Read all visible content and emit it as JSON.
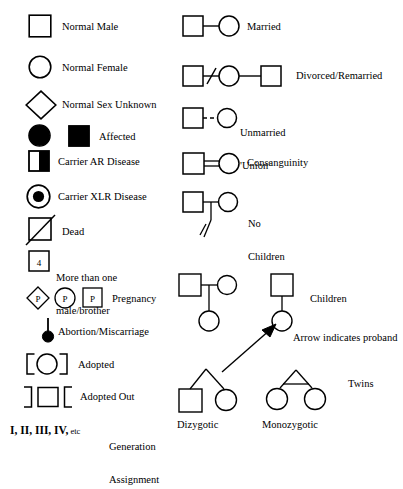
{
  "figure": {
    "stroke_color": "#000000",
    "fill_color": "#000000",
    "background": "#ffffff"
  },
  "left_column": {
    "items": [
      {
        "id": "normal-male",
        "label": "Normal Male",
        "symbol": "square-outline"
      },
      {
        "id": "normal-female",
        "label": "Normal Female",
        "symbol": "circle-outline"
      },
      {
        "id": "normal-sex-unknown",
        "label": "Normal Sex Unknown",
        "symbol": "diamond-outline"
      },
      {
        "id": "affected",
        "label": "Affected",
        "symbol": "filled-circle-and-filled-square"
      },
      {
        "id": "carrier-ar",
        "label": "Carrier AR Disease",
        "symbol": "square-half-filled"
      },
      {
        "id": "carrier-xlr",
        "label": "Carrier XLR Disease",
        "symbol": "circle-with-center-dot"
      },
      {
        "id": "dead",
        "label": "Dead",
        "symbol": "square-with-slash"
      },
      {
        "id": "more-than-one",
        "label": "More than one\nmale/brother",
        "label_line1": "More than one",
        "label_line2": "male/brother",
        "symbol": "square-with-number",
        "number": "4"
      },
      {
        "id": "pregnancy",
        "label": "Pregnancy",
        "symbol": "diamond-p-circle-p-square-p",
        "letter": "P"
      },
      {
        "id": "abortion",
        "label": "Abortion/Miscarriage",
        "symbol": "stem-with-filled-dot"
      },
      {
        "id": "adopted",
        "label": "Adopted",
        "symbol": "circle-in-inward-brackets"
      },
      {
        "id": "adopted-out",
        "label": "Adopted Out",
        "symbol": "square-in-outward-brackets"
      },
      {
        "id": "generation",
        "label": "Generation\nAssignment",
        "label_line1": "Generation",
        "label_line2": "Assignment",
        "roman": "I, II, III, IV,",
        "etc": " etc"
      }
    ]
  },
  "right_column": {
    "items": [
      {
        "id": "married",
        "label": "Married",
        "symbol": "square-line-circle"
      },
      {
        "id": "divorced",
        "label": "Divorced/Remarried",
        "symbol": "square-slash-circle-line-square"
      },
      {
        "id": "unmarried",
        "label": "Unmarried\n'Union'",
        "label_line1": "Unmarried",
        "label_line2": "'Union'",
        "symbol": "square-dashed-circle"
      },
      {
        "id": "consanguinity",
        "label": "Consanguinity",
        "symbol": "square-double-line-circle"
      },
      {
        "id": "no-children",
        "label": "No\nChildren",
        "label_line1": "No",
        "label_line2": "Children",
        "symbol": "couple-with-double-slashed-descent"
      }
    ]
  },
  "pedigree_examples": {
    "children": {
      "label": "Children",
      "left_family": {
        "father": "square",
        "mother": "circle",
        "child": "circle"
      },
      "right_family": {
        "parent": "square",
        "child": "circle"
      }
    },
    "proband": {
      "label": "Arrow indicates proband",
      "symbol": "diagonal-arrow"
    },
    "twins": {
      "label": "Twins",
      "dizygotic_label": "Dizygotic",
      "monozygotic_label": "Monozygotic",
      "dizygotic": {
        "left": "square",
        "right": "circle",
        "connector": "inverted-v"
      },
      "monozygotic": {
        "left": "circle",
        "right": "circle",
        "connector": "triangle-with-crossbar"
      }
    }
  }
}
